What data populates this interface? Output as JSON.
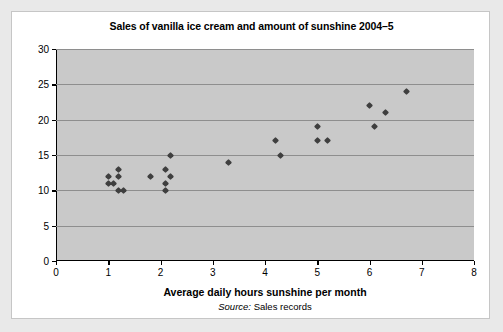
{
  "chart_data": {
    "type": "scatter",
    "title": "Sales of vanilla ice cream and amount of sunshine 2004–5",
    "xlabel": "Average daily hours sunshine per month",
    "ylabel": "Monthly sales in '000 litres",
    "source_label": "Source",
    "source_value": "Sales records",
    "xlim": [
      0,
      8
    ],
    "ylim": [
      0,
      30
    ],
    "xticks": [
      0,
      1,
      2,
      3,
      4,
      5,
      6,
      7,
      8
    ],
    "yticks": [
      0,
      5,
      10,
      15,
      20,
      25,
      30
    ],
    "grid": "horizontal",
    "legend": "none",
    "series": [
      {
        "name": "Monthly sales vs sunshine",
        "marker_color": "#3f3f3f",
        "points": [
          {
            "x": 1.0,
            "y": 12
          },
          {
            "x": 1.0,
            "y": 11
          },
          {
            "x": 1.1,
            "y": 11
          },
          {
            "x": 1.2,
            "y": 13
          },
          {
            "x": 1.2,
            "y": 12
          },
          {
            "x": 1.2,
            "y": 10
          },
          {
            "x": 1.3,
            "y": 10
          },
          {
            "x": 1.8,
            "y": 12
          },
          {
            "x": 2.1,
            "y": 13
          },
          {
            "x": 2.1,
            "y": 11
          },
          {
            "x": 2.1,
            "y": 10
          },
          {
            "x": 2.2,
            "y": 15
          },
          {
            "x": 2.2,
            "y": 12
          },
          {
            "x": 3.3,
            "y": 14
          },
          {
            "x": 4.2,
            "y": 17
          },
          {
            "x": 4.3,
            "y": 15
          },
          {
            "x": 5.0,
            "y": 19
          },
          {
            "x": 5.0,
            "y": 17
          },
          {
            "x": 5.2,
            "y": 17
          },
          {
            "x": 6.0,
            "y": 22
          },
          {
            "x": 6.1,
            "y": 19
          },
          {
            "x": 6.3,
            "y": 21
          },
          {
            "x": 6.7,
            "y": 24
          }
        ]
      }
    ]
  },
  "colors": {
    "page_background": "#e9e9e9",
    "card_background": "#ffffff",
    "plot_background": "#c9c9c9",
    "gridline": "#8e8e8e",
    "axis": "#000000",
    "marker": "#3f3f3f"
  }
}
